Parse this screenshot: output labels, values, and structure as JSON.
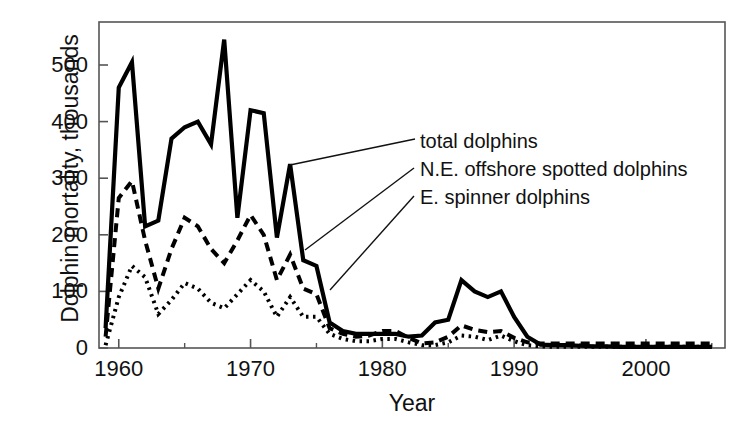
{
  "chart_data": {
    "type": "line",
    "title": "",
    "xlabel": "Year",
    "ylabel": "Dolphin mortality, thousands",
    "xlim": [
      1958.5,
      2006
    ],
    "ylim": [
      0,
      560
    ],
    "xticks": [
      1960,
      1970,
      1980,
      1990,
      2000
    ],
    "xtick_labels": [
      "1960",
      "1970",
      "1980",
      "1990",
      "2000"
    ],
    "xminorticks": [
      1965,
      1975,
      1985,
      1995,
      2005
    ],
    "yticks": [
      0,
      100,
      200,
      300,
      400,
      500
    ],
    "ytick_labels": [
      "0",
      "100",
      "200",
      "300",
      "400",
      "500"
    ],
    "grid": false,
    "legend_position": "inline-annotations",
    "x": [
      1959,
      1960,
      1961,
      1962,
      1963,
      1964,
      1965,
      1966,
      1967,
      1968,
      1969,
      1970,
      1971,
      1972,
      1973,
      1974,
      1975,
      1976,
      1977,
      1978,
      1979,
      1980,
      1981,
      1982,
      1983,
      1984,
      1985,
      1986,
      1987,
      1988,
      1989,
      1990,
      1991,
      1992,
      1993,
      1994,
      1995,
      1996,
      1997,
      1998,
      1999,
      2000,
      2001,
      2002,
      2003,
      2004,
      2005
    ],
    "series": [
      {
        "name": "total dolphins",
        "style": "solid",
        "color": "#000000",
        "values": [
          35,
          460,
          505,
          215,
          225,
          370,
          390,
          400,
          360,
          545,
          230,
          420,
          415,
          195,
          325,
          155,
          145,
          45,
          30,
          25,
          25,
          25,
          25,
          20,
          22,
          45,
          50,
          120,
          100,
          90,
          100,
          55,
          20,
          6,
          5,
          5,
          4,
          3,
          3,
          2,
          2,
          2,
          2,
          2,
          2,
          2,
          2
        ]
      },
      {
        "name": "N.E. offshore spotted dolphins",
        "style": "dashed",
        "color": "#000000",
        "values": [
          20,
          265,
          295,
          190,
          105,
          175,
          230,
          215,
          175,
          150,
          190,
          235,
          200,
          120,
          165,
          105,
          95,
          35,
          25,
          20,
          22,
          30,
          30,
          18,
          8,
          10,
          20,
          40,
          32,
          28,
          30,
          18,
          10,
          8,
          8,
          8,
          8,
          8,
          8,
          8,
          8,
          8,
          8,
          8,
          8,
          8,
          8
        ]
      },
      {
        "name": "E. spinner dolphins",
        "style": "dotted",
        "color": "#000000",
        "values": [
          5,
          90,
          145,
          125,
          60,
          85,
          115,
          105,
          80,
          70,
          95,
          120,
          100,
          55,
          90,
          55,
          55,
          25,
          16,
          12,
          12,
          16,
          16,
          10,
          5,
          5,
          10,
          22,
          20,
          14,
          22,
          12,
          5,
          3,
          2,
          2,
          2,
          2,
          2,
          2,
          2,
          2,
          2,
          2,
          2,
          2,
          2
        ]
      }
    ],
    "annotations": [
      {
        "label": "total dolphins",
        "text_x": 420,
        "text_y": 130,
        "leader_from": [
          415,
          139
        ],
        "leader_to": [
          290,
          165
        ]
      },
      {
        "label": "N.E. offshore spotted dolphins",
        "text_x": 420,
        "text_y": 158,
        "leader_from": [
          414,
          168
        ],
        "leader_to": [
          305,
          250
        ]
      },
      {
        "label": "E. spinner dolphins",
        "text_x": 420,
        "text_y": 186,
        "leader_from": [
          414,
          196
        ],
        "leader_to": [
          330,
          290
        ]
      }
    ]
  },
  "axis": {
    "y_title": "Dolphin mortality, thousands",
    "x_title": "Year"
  }
}
